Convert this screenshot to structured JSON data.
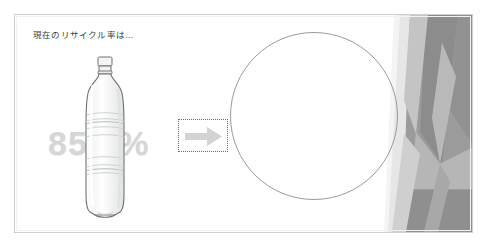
{
  "page": {
    "cut_off_caption": "",
    "width": 491,
    "height": 247
  },
  "slide": {
    "heading": "現在のリサイクル率は…",
    "percentage": "85.8%",
    "background_color": "#ffffff",
    "border_color": "#cfcfcf",
    "heading_color": "#3b3b3b",
    "percentage_color": "#d6d6d6"
  },
  "objects": {
    "bottle": {
      "name": "pet-bottle-image",
      "alt": "clear PET plastic bottle"
    },
    "arrow": {
      "name": "right-arrow-shape",
      "alt": "right pointing block arrow",
      "fill_color": "#d3d3d3",
      "selected": true,
      "selection_border_color": "#6d6d6d"
    },
    "circle": {
      "name": "empty-circle-shape",
      "alt": "empty outlined circle placeholder",
      "stroke_color": "#9a9a9a",
      "fill": "none"
    },
    "decoration": {
      "name": "angular-ribbon-decoration",
      "alt": "angular faceted gray ribbon design element",
      "colors": [
        "#8e8e8e",
        "#9e9e9e",
        "#b4b4b4",
        "#c6c6c6",
        "#d8d8d8",
        "#efefef"
      ]
    }
  }
}
